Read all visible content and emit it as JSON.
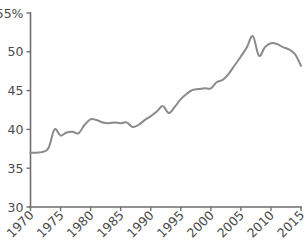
{
  "chart_data": {
    "type": "line",
    "title": "",
    "subtitle": "",
    "xlabel": "",
    "ylabel": "",
    "y_unit_label": "55%",
    "xlim": [
      1970,
      2015
    ],
    "ylim": [
      30,
      55
    ],
    "grid": false,
    "legend": false,
    "legend_position": "none",
    "line_color": "#8a8a8a",
    "axis_color": "#6e6e6e",
    "tick_label_color": "#4a4a4a",
    "x_tick_labels": [
      "1970",
      "1975",
      "1980",
      "1985",
      "1990",
      "1995",
      "2000",
      "2005",
      "2010",
      "2015"
    ],
    "x_tick_values": [
      1970,
      1975,
      1980,
      1985,
      1990,
      1995,
      2000,
      2005,
      2010,
      2015
    ],
    "x_tick_rotation_deg": 45,
    "y_tick_labels": [
      "30",
      "35",
      "40",
      "45",
      "50",
      "55%"
    ],
    "y_tick_values": [
      30,
      35,
      40,
      45,
      50,
      55
    ],
    "series": [
      {
        "name": "share",
        "x": [
          1970,
          1971,
          1972,
          1973,
          1974,
          1975,
          1976,
          1977,
          1978,
          1979,
          1980,
          1981,
          1982,
          1983,
          1984,
          1985,
          1986,
          1987,
          1988,
          1989,
          1990,
          1991,
          1992,
          1993,
          1994,
          1995,
          1996,
          1997,
          1998,
          1999,
          2000,
          2001,
          2002,
          2003,
          2004,
          2005,
          2006,
          2007,
          2008,
          2009,
          2010,
          2011,
          2012,
          2013,
          2014,
          2015
        ],
        "values": [
          37.0,
          37.0,
          37.1,
          37.6,
          40.0,
          39.2,
          39.6,
          39.7,
          39.5,
          40.6,
          41.3,
          41.2,
          40.9,
          40.8,
          40.9,
          40.8,
          40.9,
          40.3,
          40.6,
          41.2,
          41.7,
          42.3,
          43.0,
          42.1,
          42.9,
          43.9,
          44.6,
          45.1,
          45.2,
          45.3,
          45.3,
          46.1,
          46.4,
          47.2,
          48.3,
          49.4,
          50.6,
          52.0,
          49.5,
          50.6,
          51.1,
          51.0,
          50.6,
          50.3,
          49.7,
          48.2
        ]
      }
    ]
  },
  "figure": {
    "background_color": "#ffffff"
  }
}
